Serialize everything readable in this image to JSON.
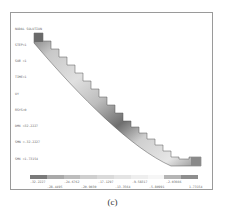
{
  "figure": {
    "caption": "(c)",
    "info_lines": [
      "NODAL SOLUTION",
      "STEP=1",
      "SUB =1",
      "TIME=1",
      "UY",
      "RSYS=0",
      "DMX =32.2227",
      "SMN =-32.2227",
      "SMX =1.73154"
    ],
    "legend": {
      "colors": [
        "#7a7a7a",
        "#a9a9a9",
        "#bdbdbd",
        "#cfcfcf",
        "#dadada",
        "#e4e4e4",
        "#eeeeee",
        "#f6f6f6",
        "#b5b5b5",
        "#8e8e8e"
      ],
      "labels_top": [
        "-32.2227",
        "-24.6762",
        "-17.1297",
        "-9.58317",
        "-2.03666"
      ],
      "labels_bottom": [
        "-28.4495",
        "-20.9030",
        "-13.3564",
        "-5.80991",
        "1.73154"
      ]
    }
  }
}
